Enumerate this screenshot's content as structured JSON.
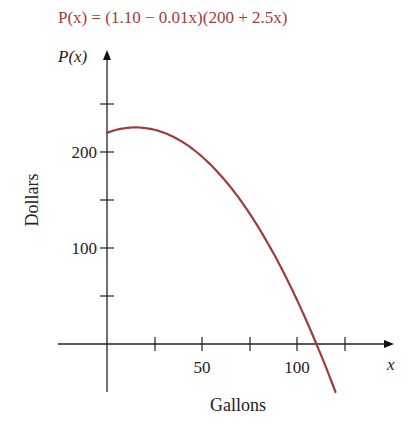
{
  "chart_data": {
    "type": "line",
    "title": "P(x) = (1.10 − 0.01x)(200 + 2.5x)",
    "xlabel": "Gallons",
    "ylabel": "Dollars",
    "x_axis_name": "x",
    "y_axis_name": "P(x)",
    "xlim": [
      -25,
      145
    ],
    "ylim": [
      -50,
      250
    ],
    "x_ticks": [
      25,
      50,
      75,
      100,
      125
    ],
    "x_tick_labels": [
      "",
      "50",
      "",
      "100",
      ""
    ],
    "y_ticks": [
      50,
      100,
      150,
      200,
      250
    ],
    "y_tick_labels": [
      "",
      "100",
      "",
      "200",
      ""
    ],
    "grid": false,
    "legend": null,
    "series": [
      {
        "name": "P(x)",
        "color": "#a03a3c",
        "function": "(1.10 - 0.01*x)*(200 + 2.5*x)",
        "x": [
          0,
          10,
          17.5,
          25,
          50,
          75,
          100,
          110,
          120
        ],
        "values": [
          220,
          225,
          225.8,
          222.5,
          195,
          142.5,
          50,
          0,
          -50
        ]
      }
    ]
  },
  "text": {
    "formula_prefix": "P(x)",
    "formula_rest": " = (1.10 − 0.01x)(200 + 2.5x)",
    "y_axis_name": "P(x)",
    "x_axis_name": "x",
    "ylabel": "Dollars",
    "xlabel": "Gallons",
    "tick_50": "50",
    "tick_100_x": "100",
    "tick_100_y": "100",
    "tick_200_y": "200"
  }
}
